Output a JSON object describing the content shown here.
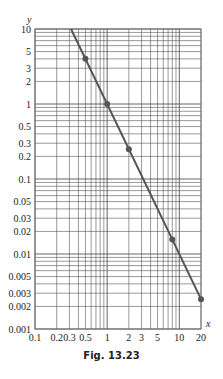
{
  "figure": {
    "caption": "Fig. 13.23"
  },
  "chart_data": {
    "type": "line",
    "title": "",
    "xlabel": "x",
    "ylabel": "y",
    "xscale": "log",
    "yscale": "log",
    "xlim": [
      0.1,
      20
    ],
    "ylim": [
      0.001,
      10
    ],
    "grid": true,
    "x_tick_labels": [
      "0.1",
      "0.2",
      "0.3",
      "0.5",
      "1",
      "2",
      "3",
      "5",
      "10",
      "20"
    ],
    "x_ticks": [
      0.1,
      0.2,
      0.3,
      0.5,
      1,
      2,
      3,
      5,
      10,
      20
    ],
    "y_tick_labels": [
      "10",
      "5",
      "3",
      "2",
      "1",
      "0.5",
      "0.3",
      "0.2",
      "0.1",
      "0.05",
      "0.03",
      "0.02",
      "0.01",
      "0.005",
      "0.003",
      "0.002",
      "0.001"
    ],
    "y_ticks": [
      10,
      5,
      3,
      2,
      1,
      0.5,
      0.3,
      0.2,
      0.1,
      0.05,
      0.03,
      0.02,
      0.01,
      0.005,
      0.003,
      0.002,
      0.001
    ],
    "series": [
      {
        "name": "y = 1/x^2",
        "line": {
          "x": [
            0.316,
            20
          ],
          "y": [
            10,
            0.0025
          ]
        },
        "points": {
          "x": [
            0.5,
            1,
            2,
            8,
            20
          ],
          "y": [
            4,
            1,
            0.25,
            0.015625,
            0.0025
          ]
        },
        "color": "#555555"
      }
    ]
  },
  "layout": {
    "plot": {
      "left": 35,
      "right": 201,
      "top": 29,
      "bottom": 329
    },
    "colors": {
      "grid": "#555555",
      "frame": "#777777",
      "line": "#555555",
      "marker": "#555555"
    }
  }
}
